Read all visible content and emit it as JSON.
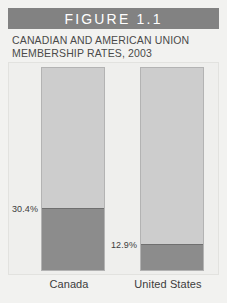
{
  "figure": {
    "banner_label": "FIGURE 1.1",
    "subtitle_line1": "CANADIAN AND AMERICAN UNION",
    "subtitle_line2": "MEMBERSHIP RATES, 2003"
  },
  "colors": {
    "banner_background": "#828282",
    "banner_text": "#ffffff",
    "page_background": "#f2f2f0",
    "plot_background": "#efefed",
    "bar_track": "#cdcdcd",
    "bar_track_border": "#b3b3b3",
    "bar_fill": "#8c8c8c",
    "bar_fill_border": "#6f6f6f",
    "text": "#3c3c3c"
  },
  "chart_data": {
    "type": "bar",
    "title": "FIGURE 1.1",
    "subtitle": "CANADIAN AND AMERICAN UNION MEMBERSHIP RATES, 2003",
    "xlabel": "",
    "ylabel": "",
    "ylim": [
      0,
      100
    ],
    "grid": false,
    "legend": "none",
    "unit": "%",
    "categories": [
      "Canada",
      "United States"
    ],
    "values": [
      30.4,
      12.9
    ],
    "data_labels": [
      "30.4%",
      "12.9%"
    ],
    "series": [
      {
        "name": "Union membership rate, 2003",
        "values": [
          30.4,
          12.9
        ]
      }
    ]
  },
  "bars": [
    {
      "category": "Canada",
      "value": 30.4,
      "label": "30.4%"
    },
    {
      "category": "United States",
      "value": 12.9,
      "label": "12.9%"
    }
  ]
}
